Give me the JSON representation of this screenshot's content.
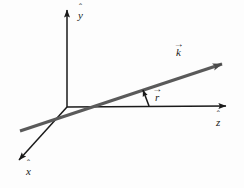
{
  "figure": {
    "background_color": "#fdfdfd",
    "ink_color": "#1a1a1a",
    "thick_line_color": "#5a5a5a",
    "labels": {
      "y_axis": {
        "symbol": "y",
        "accent": "hat",
        "accent_glyph": "ˆ",
        "text": "ŷ"
      },
      "x_axis": {
        "symbol": "x",
        "accent": "hat",
        "accent_glyph": "ˆ",
        "text": "x̂"
      },
      "z_axis": {
        "symbol": "z",
        "accent": "hat",
        "accent_glyph": "ˆ",
        "text": "ẑ"
      },
      "k_vector": {
        "symbol": "k",
        "accent": "vector-arrow",
        "accent_glyph": "→",
        "text": "k⃗"
      },
      "r_angle": {
        "symbol": "r",
        "accent": "vector-arrow",
        "accent_glyph": "→",
        "text": "r⃗"
      }
    },
    "geometry": {
      "origin": {
        "x": 67,
        "y": 107
      },
      "y_axis_tip": {
        "x": 67,
        "y": 5
      },
      "z_axis_tip": {
        "x": 232,
        "y": 106
      },
      "x_axis_tip": {
        "x": 14,
        "y": 164
      },
      "k_line_start": {
        "x": 20,
        "y": 131
      },
      "k_line_tip": {
        "x": 229,
        "y": 61
      },
      "angle_arrow_start": {
        "x": 149,
        "y": 106
      },
      "angle_arrow_tip": {
        "x": 142,
        "y": 87
      }
    }
  },
  "ghost_text": {
    "line_a": "            ",
    "line_b": "             ",
    "line_c": "                ",
    "line_d": "                 "
  }
}
